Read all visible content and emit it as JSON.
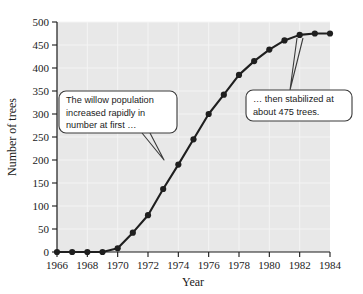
{
  "chart_data": {
    "type": "line",
    "title": "",
    "xlabel": "Year",
    "ylabel": "Number of trees",
    "xlim": [
      1966,
      1984
    ],
    "ylim": [
      0,
      500
    ],
    "grid": true,
    "legend": "none",
    "x": [
      1966,
      1967,
      1968,
      1969,
      1970,
      1971,
      1972,
      1973,
      1974,
      1975,
      1976,
      1977,
      1978,
      1979,
      1980,
      1981,
      1982,
      1983,
      1984
    ],
    "values": [
      0,
      0,
      0,
      0,
      8,
      42,
      80,
      137,
      190,
      245,
      300,
      342,
      385,
      415,
      440,
      460,
      472,
      475,
      475
    ],
    "series": [
      {
        "name": "Willow population",
        "values": [
          0,
          0,
          0,
          0,
          8,
          42,
          80,
          137,
          190,
          245,
          300,
          342,
          385,
          415,
          440,
          460,
          472,
          475,
          475
        ]
      }
    ],
    "xticks": [
      1966,
      1968,
      1970,
      1972,
      1974,
      1976,
      1978,
      1980,
      1982,
      1984
    ],
    "xticklabels": [
      "1966",
      "1968",
      "1970",
      "1972",
      "1974",
      "1976",
      "1978",
      "1980",
      "1982",
      "1984"
    ],
    "yticks": [
      0,
      50,
      100,
      150,
      200,
      250,
      300,
      350,
      400,
      450,
      500
    ],
    "yticklabels": [
      "0",
      "50",
      "100",
      "150",
      "200",
      "250",
      "300",
      "350",
      "400",
      "450",
      "500"
    ],
    "annotations": [
      {
        "id": "callout-left",
        "lines": [
          "The willow population",
          "increased rapidly in",
          "number at first …"
        ],
        "points_to_year": 1973
      },
      {
        "id": "callout-right",
        "lines": [
          "… then  stabilized at",
          "about 475 trees."
        ],
        "points_to_year": 1982
      }
    ],
    "colors": {
      "plot_background": "#e8e8e8",
      "grid": "#f4f4f4",
      "line": "#1f1f1f",
      "marker": "#1f1f1f",
      "axis": "#1a1a1a",
      "callout_background": "#ffffff",
      "callout_border": "#3a3a3a"
    }
  }
}
